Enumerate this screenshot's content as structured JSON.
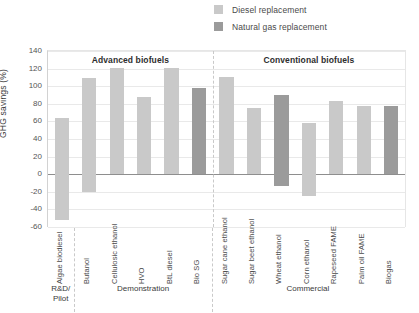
{
  "legend": {
    "position": "top-right",
    "items": [
      {
        "label": "Diesel replacement",
        "color": "#c9c9c9",
        "key": "diesel"
      },
      {
        "label": "Natural gas replacement",
        "color": "#9b9b9b",
        "key": "natural_gas"
      }
    ]
  },
  "chart_data": {
    "type": "bar",
    "title": "",
    "xlabel": "",
    "ylabel": "GHG savings (%)",
    "ylim": [
      -60,
      140
    ],
    "ytick_step": 20,
    "yticks": [
      140,
      120,
      100,
      80,
      60,
      40,
      20,
      0,
      -20,
      -40,
      -60
    ],
    "grid": true,
    "categories": [
      "Algae biodiesel",
      "Butanol",
      "Cellulosic ethanol",
      "HVO",
      "BtL diesel",
      "Bio SG",
      "Sugar cane ethanol",
      "Sugar beet ethanol",
      "Wheat ethanol",
      "Corn ethanol",
      "Rapeseed FAME",
      "Palm oil FAME",
      "Biogas"
    ],
    "values": [
      64,
      109,
      121,
      88,
      121,
      98,
      110,
      75,
      90,
      58,
      83,
      78,
      78
    ],
    "negative_values": [
      -52,
      -20,
      0,
      0,
      0,
      0,
      0,
      0,
      -13,
      -25,
      0,
      0,
      0
    ],
    "series_key": [
      "diesel",
      "diesel",
      "diesel",
      "diesel",
      "diesel",
      "natural_gas",
      "diesel",
      "diesel",
      "natural_gas",
      "diesel",
      "diesel",
      "diesel",
      "natural_gas"
    ],
    "annotations": {
      "top_groups": [
        {
          "label": "Advanced biofuels",
          "from": 0,
          "to": 5
        },
        {
          "label": "Conventional biofuels",
          "from": 6,
          "to": 12
        }
      ],
      "bottom_groups": [
        {
          "label": "R&D/\nPilot",
          "line1": "R&D/",
          "line2": "Pilot",
          "from": 0,
          "to": 0
        },
        {
          "label": "Demonstration",
          "line1": "Demonstration",
          "line2": "",
          "from": 1,
          "to": 5
        },
        {
          "label": "Commercial",
          "line1": "Commercial",
          "line2": "",
          "from": 6,
          "to": 12
        }
      ]
    }
  }
}
